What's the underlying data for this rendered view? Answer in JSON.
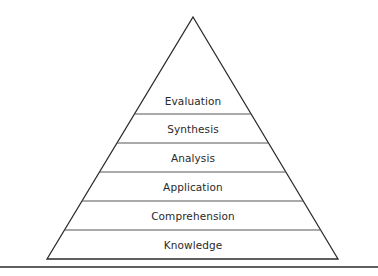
{
  "diagram": {
    "type": "pyramid",
    "apex": [
      193,
      17
    ],
    "base_left": [
      47,
      259
    ],
    "base_right": [
      338,
      259
    ],
    "divider_ys": [
      114,
      143,
      172,
      201,
      230
    ],
    "bottom_rule_y": 267,
    "line_color": "#2b2b2b",
    "divider_color": "#555555",
    "levels": [
      {
        "label": "Evaluation",
        "y": 94
      },
      {
        "label": "Synthesis",
        "y": 122
      },
      {
        "label": "Analysis",
        "y": 151
      },
      {
        "label": "Application",
        "y": 180
      },
      {
        "label": "Comprehension",
        "y": 209
      },
      {
        "label": "Knowledge",
        "y": 238
      }
    ]
  }
}
